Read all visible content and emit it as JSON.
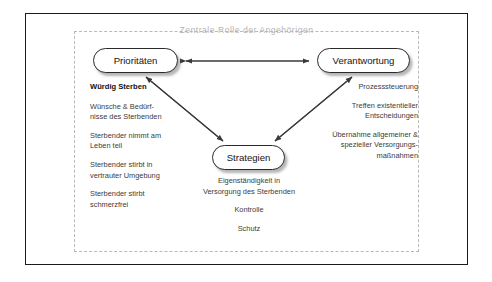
{
  "diagram": {
    "container_title": "Zentrale Rolle der Angehörigen",
    "nodes": {
      "priorities": {
        "label": "Prioritäten"
      },
      "responsibility": {
        "label": "Verantwortung"
      },
      "strategies": {
        "label": "Strategien"
      }
    },
    "left_column": {
      "heading": "Würdig Sterben",
      "items": [
        "Wünsche & Bedürf-\nnisse des Sterbenden",
        "Sterbender nimmt am\nLeben teil",
        "Sterbender stirbt in\nvertrauter Umgebung",
        "Sterbender stirbt\nschmerzfrei"
      ]
    },
    "right_column": {
      "items": [
        "Prozesssteuerung",
        "Treffen existentieller\nEntscheidungen",
        "Übernahme allgemeiner &\nspezieller Versorgungs-\nmaßnahmen"
      ]
    },
    "center_column": {
      "items": [
        "Eigenständigkeit in\nVersorgung des Sterbenden",
        "Kontrolle",
        "Schutz"
      ]
    },
    "connectors": [
      {
        "name": "priorities-responsibility",
        "style": "double-arrow"
      },
      {
        "name": "priorities-strategies",
        "style": "double-arrow"
      },
      {
        "name": "responsibility-strategies",
        "style": "double-arrow"
      }
    ],
    "colors": {
      "outer_border": "#1b1b1b",
      "dashed_border": "#b9b9b9",
      "title_text": "#b4b4b4",
      "node_border": "#2a2a2a",
      "node_fill": "#ffffff",
      "body_text": "#3b3b3b",
      "connector": "#3a3a3a"
    }
  }
}
